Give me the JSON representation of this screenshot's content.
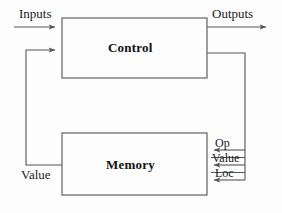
{
  "diagram": {
    "background_color": "#fdfdfd",
    "line_color": "#555555",
    "text_color": "#111111",
    "blocks": [
      {
        "id": "control",
        "label": "Control",
        "x": 62,
        "y": 18,
        "width": 145,
        "height": 60
      },
      {
        "id": "memory",
        "label": "Memory",
        "x": 62,
        "y": 133,
        "width": 145,
        "height": 62
      }
    ],
    "signals": {
      "inputs": "Inputs",
      "outputs": "Outputs",
      "op": "Op",
      "value_right": "Value",
      "loc": "Loc",
      "value_left": "Value"
    }
  }
}
